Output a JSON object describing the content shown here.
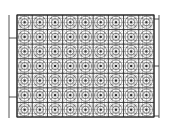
{
  "diagram": {
    "type": "tiled-pattern-grid",
    "background": "#ffffff",
    "line_color": "#2a2a2a",
    "grid": {
      "x": 17,
      "y": 15,
      "width": 137,
      "height": 102,
      "columns": 9,
      "rows": 7,
      "motif": "circular-rosette-in-subgrid",
      "subdivisions": 4
    },
    "left_rail": {
      "x": 9,
      "y1": 15,
      "y2": 118,
      "ticks_y": [
        38,
        97
      ]
    },
    "right_rail": {
      "x": 159,
      "y1": 15,
      "y2": 118,
      "ticks_y": [
        19,
        66,
        116
      ]
    }
  }
}
